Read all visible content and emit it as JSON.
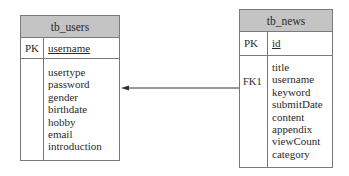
{
  "diagram": {
    "type": "er-diagram",
    "entities": [
      {
        "name": "tb_users",
        "primary_key": {
          "label": "PK",
          "field": "username"
        },
        "fields": [
          "usertype",
          "password",
          "gender",
          "birthdate",
          "hobby",
          "email",
          "introduction"
        ]
      },
      {
        "name": "tb_news",
        "primary_key": {
          "label": "PK",
          "field": "id"
        },
        "fk_label": "FK1",
        "fields": [
          "title",
          "username",
          "keyword",
          "submitDate",
          "content",
          "appendix",
          "viewCount",
          "category"
        ]
      }
    ],
    "relationships": [
      {
        "from": "tb_news",
        "from_key": "FK1",
        "to": "tb_users",
        "style": "arrow"
      }
    ],
    "colors": {
      "header_fill": "#c4c4c4",
      "border": "#7a7a7a",
      "line": "#333333"
    }
  }
}
